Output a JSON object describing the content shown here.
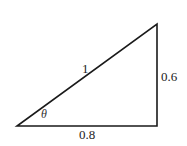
{
  "diagram": {
    "type": "right-triangle",
    "stroke_color": "#1a1a1a",
    "vertices": {
      "left": [
        17,
        126
      ],
      "bottom_right": [
        157,
        126
      ],
      "top_right": [
        157,
        24
      ]
    },
    "labels": {
      "hypotenuse": "1",
      "vertical_leg": "0.6",
      "horizontal_leg": "0.8",
      "angle": "θ"
    }
  }
}
